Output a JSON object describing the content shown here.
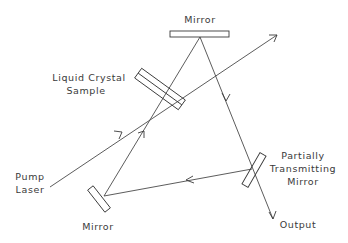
{
  "diagram": {
    "labels": {
      "top_mirror": "Mirror",
      "crystal_line1": "Liquid Crystal",
      "crystal_line2": "Sample",
      "pump_line1": "Pump",
      "pump_line2": "Laser",
      "pt_line1": "Partially",
      "pt_line2": "Transmitting",
      "pt_line3": "Mirror",
      "output": "Output",
      "bottom_mirror": "Mirror"
    },
    "components": [
      {
        "id": "top-mirror",
        "type": "mirror"
      },
      {
        "id": "liquid-crystal-sample",
        "type": "sample"
      },
      {
        "id": "partially-transmitting-mirror",
        "type": "beam-splitter"
      },
      {
        "id": "bottom-mirror",
        "type": "mirror"
      }
    ],
    "beams": [
      {
        "from": "pump-laser",
        "to": "exit-top-right",
        "via": "liquid-crystal-sample"
      },
      {
        "from": "top-mirror",
        "to": "partially-transmitting-mirror",
        "continues_to": "output"
      },
      {
        "from": "partially-transmitting-mirror",
        "to": "bottom-mirror"
      },
      {
        "from": "bottom-mirror",
        "to": "liquid-crystal-sample"
      },
      {
        "from": "liquid-crystal-sample",
        "to": "top-mirror"
      }
    ],
    "colors": {
      "line": "#3a3a3a",
      "background": "#ffffff"
    }
  }
}
